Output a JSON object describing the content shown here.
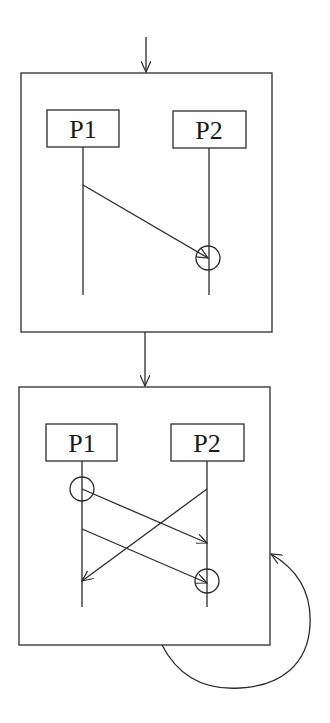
{
  "diagram": {
    "type": "message-sequence-flow",
    "entry_arrow": {
      "from": [
        146,
        37
      ],
      "to": [
        146,
        73
      ]
    },
    "transition_arrow": {
      "from": [
        145,
        332
      ],
      "to": [
        145,
        387
      ]
    },
    "states": [
      {
        "id": "state-1",
        "frame": {
          "x": 21,
          "y": 73,
          "w": 251,
          "h": 259
        },
        "processes": [
          {
            "label": "P1",
            "box": {
              "x": 47,
              "y": 110,
              "w": 72,
              "h": 37
            },
            "lifeline_x": 83,
            "lifeline_end": 295
          },
          {
            "label": "P2",
            "box": {
              "x": 173,
              "y": 111,
              "w": 73,
              "h": 37
            },
            "lifeline_x": 209,
            "lifeline_end": 295
          }
        ],
        "messages": [
          {
            "from": "P1",
            "to": "P2",
            "start": [
              83,
              185
            ],
            "end": [
              208,
              258
            ]
          }
        ],
        "receive_events": [
          {
            "process": "P2",
            "center": [
              208,
              258
            ],
            "r": 12
          }
        ]
      },
      {
        "id": "state-2",
        "frame": {
          "x": 19,
          "y": 387,
          "w": 251,
          "h": 258
        },
        "processes": [
          {
            "label": "P1",
            "box": {
              "x": 46,
              "y": 424,
              "w": 71,
              "h": 37
            },
            "lifeline_x": 82,
            "lifeline_end": 607
          },
          {
            "label": "P2",
            "box": {
              "x": 171,
              "y": 424,
              "w": 73,
              "h": 37
            },
            "lifeline_x": 207,
            "lifeline_end": 607
          }
        ],
        "messages": [
          {
            "from": "P1",
            "to": "P2",
            "start": [
              82,
              489
            ],
            "end": [
              207,
              543
            ]
          },
          {
            "from": "P2",
            "to": "P1",
            "start": [
              207,
              489
            ],
            "end": [
              82,
              581
            ]
          },
          {
            "from": "P1",
            "to": "P2",
            "start": [
              82,
              529
            ],
            "end": [
              207,
              583
            ]
          }
        ],
        "receive_events": [
          {
            "process": "P1",
            "center": [
              82,
              489
            ],
            "r": 12
          },
          {
            "process": "P2",
            "center": [
              207,
              581
            ],
            "r": 12
          }
        ]
      }
    ],
    "self_loop": {
      "start": [
        162,
        645
      ],
      "end": [
        270,
        553
      ],
      "label": ""
    }
  },
  "labels": {
    "s1_p1": "P1",
    "s1_p2": "P2",
    "s2_p1": "P1",
    "s2_p2": "P2"
  },
  "colors": {
    "stroke": "#2b2b2b",
    "background": "#ffffff"
  }
}
